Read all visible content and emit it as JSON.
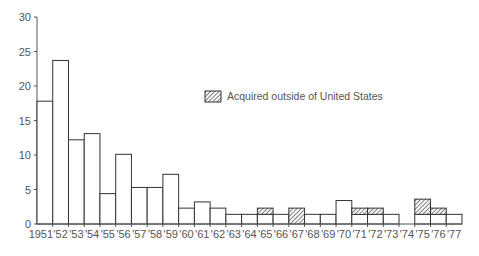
{
  "chart_data": {
    "type": "bar",
    "title": "",
    "xlabel": "",
    "ylabel": "",
    "ylim": [
      0,
      30
    ],
    "yticks": [
      0,
      5,
      10,
      15,
      20,
      25,
      30
    ],
    "grid": false,
    "legend": {
      "position": "upper-center-right",
      "entries": [
        {
          "label": "Acquired outside of United States",
          "pattern": "diagonal-hatch"
        }
      ]
    },
    "categories": [
      "1951",
      "'52",
      "'53",
      "'54",
      "'55",
      "'56",
      "'57",
      "'58",
      "'59",
      "'60",
      "'61",
      "'62",
      "'63",
      "'64",
      "'65",
      "'66",
      "'67",
      "'68",
      "'69",
      "'70",
      "'71",
      "'72",
      "'73",
      "'74",
      "'75",
      "'76",
      "'77"
    ],
    "years": [
      1951,
      1952,
      1953,
      1954,
      1955,
      1956,
      1957,
      1958,
      1959,
      1960,
      1961,
      1962,
      1963,
      1964,
      1965,
      1966,
      1967,
      1968,
      1969,
      1970,
      1971,
      1972,
      1973,
      1974,
      1975,
      1976,
      1977
    ],
    "series": [
      {
        "name": "Total",
        "values": [
          17.8,
          23.7,
          12.2,
          13.1,
          4.4,
          10.1,
          5.3,
          5.3,
          7.2,
          2.3,
          3.2,
          2.3,
          1.4,
          1.4,
          2.3,
          1.4,
          2.3,
          1.4,
          1.4,
          3.4,
          2.3,
          2.3,
          1.4,
          0,
          3.6,
          2.3,
          1.4
        ]
      },
      {
        "name": "Acquired outside of United States",
        "values": [
          0,
          0,
          0,
          0,
          0,
          0,
          0,
          0,
          0,
          0,
          0,
          0,
          0,
          0,
          0.9,
          0,
          2.3,
          0,
          0,
          0,
          0.9,
          0.9,
          0,
          0,
          2.2,
          0.9,
          0
        ]
      }
    ],
    "stacking": "outside-US portion drawn hatched at top of each bar"
  },
  "colors": {
    "bar_fill": "#ffffff",
    "bar_stroke": "#333333",
    "hatch": "#444444",
    "axis": "#555555",
    "text": "#555555"
  }
}
